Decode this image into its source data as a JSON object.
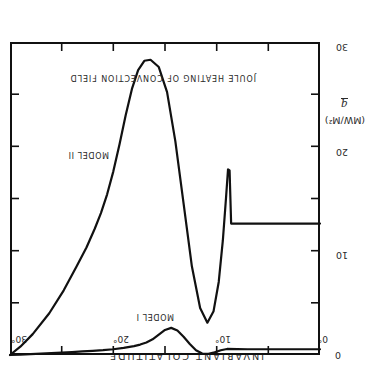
{
  "figure": {
    "top_axis_title": "INVARIANT COLATITUDE",
    "inner_title": "JOULE HEATING OF CONVECTION FIELD",
    "y_axis_symbol": "q",
    "y_axis_units": "(MW/M²)",
    "curve_label_model_1": "MODEL I",
    "curve_label_model_2": "MODEL II",
    "x_tick_0": "0°",
    "x_tick_10": "10°",
    "x_tick_20": "20°",
    "x_tick_30": "30°",
    "y_tick_0": "0",
    "y_tick_10": "10",
    "y_tick_20": "20",
    "y_tick_30": "30",
    "orientation": "rotated-180",
    "line_color": "#111111",
    "text_color": "#2b2b2b",
    "background_color": "#ffffff"
  },
  "chart_data": {
    "type": "line",
    "title": "JOULE HEATING OF CONVECTION FIELD",
    "xlabel": "INVARIANT COLATITUDE",
    "ylabel": "q (MW/M²)",
    "xlim": [
      0,
      30
    ],
    "ylim": [
      0,
      30
    ],
    "y_axis_inverted": true,
    "x_axis_inverted": true,
    "x_ticks": [
      0,
      5,
      10,
      15,
      20,
      25,
      30
    ],
    "x_tick_labels": [
      "0°",
      "",
      "10°",
      "",
      "20°",
      "",
      "30°"
    ],
    "y_ticks": [
      0,
      5,
      10,
      15,
      20,
      25,
      30
    ],
    "y_tick_labels": [
      "0",
      "",
      "10",
      "",
      "20",
      "",
      "30"
    ],
    "grid": false,
    "legend": "inline-labels",
    "series": [
      {
        "name": "MODEL I",
        "x": [
          0.0,
          1.0,
          2.0,
          3.0,
          4.0,
          5.0,
          6.0,
          7.0,
          8.0,
          9.0,
          9.6,
          10.2,
          10.8,
          11.4,
          12.0,
          12.6,
          13.2,
          13.8,
          14.4,
          15.0,
          15.6,
          16.2,
          16.8,
          17.4,
          18.0,
          19.0,
          20.0,
          21.0,
          22.0,
          23.0,
          24.0,
          25.0,
          26.0,
          27.0,
          28.0,
          29.0,
          30.0
        ],
        "y": [
          0.55,
          0.55,
          0.55,
          0.55,
          0.55,
          0.55,
          0.55,
          0.55,
          0.56,
          0.58,
          0.45,
          0.25,
          0.12,
          0.14,
          0.45,
          1.05,
          1.75,
          2.35,
          2.6,
          2.4,
          1.95,
          1.5,
          1.2,
          1.0,
          0.85,
          0.68,
          0.55,
          0.46,
          0.4,
          0.34,
          0.28,
          0.23,
          0.18,
          0.13,
          0.09,
          0.04,
          0.0
        ]
      },
      {
        "name": "MODEL II",
        "x": [
          0.0,
          1.0,
          2.0,
          3.0,
          4.0,
          5.0,
          6.0,
          7.0,
          8.0,
          8.6,
          8.75,
          8.9,
          9.1,
          9.4,
          9.8,
          10.3,
          10.9,
          11.6,
          12.4,
          13.2,
          14.0,
          14.8,
          15.6,
          16.4,
          17.0,
          17.6,
          18.2,
          18.8,
          19.4,
          20.0,
          20.6,
          21.2,
          21.8,
          22.6,
          23.6,
          24.8,
          26.2,
          27.8,
          29.0,
          30.0
        ],
        "y": [
          12.6,
          12.6,
          12.6,
          12.6,
          12.6,
          12.6,
          12.6,
          12.6,
          12.6,
          12.6,
          17.7,
          17.8,
          15.0,
          11.0,
          7.0,
          4.2,
          3.1,
          4.5,
          8.5,
          14.5,
          20.5,
          25.2,
          27.6,
          28.3,
          28.2,
          27.3,
          25.5,
          23.0,
          20.2,
          17.6,
          15.4,
          13.6,
          12.1,
          10.3,
          8.4,
          6.2,
          4.0,
          2.0,
          0.8,
          0.0
        ]
      }
    ]
  }
}
